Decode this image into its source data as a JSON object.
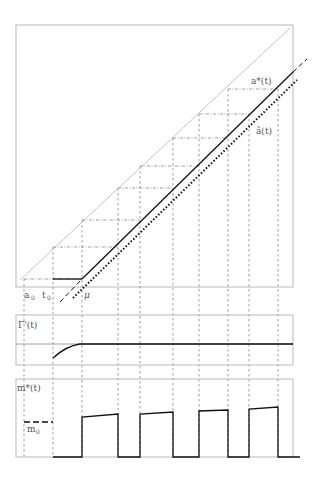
{
  "figure": {
    "panels": [
      {
        "id": "main",
        "description": "threshold diagram with diagonal and a*(t), ã(t) lines"
      },
      {
        "id": "gamma",
        "label": "Γ'(t)"
      },
      {
        "id": "mstar",
        "label": "m*(t)"
      }
    ],
    "labels": {
      "a_star": "a*(t)",
      "a_tilde": "ã(t)",
      "a0_base": "a",
      "a0_sub": "0",
      "t0_base": "t",
      "t0_sub": "0",
      "mu": "μ",
      "gamma_prime": "Γ'(t)",
      "m_star": "m*(t)",
      "m0_base": "m",
      "m0_sub": "0"
    },
    "vertical_grid_x": [
      24,
      53,
      82,
      118,
      140,
      173,
      199,
      228,
      249,
      278
    ],
    "horizontal_grid": [
      {
        "y": 279,
        "x1": 24,
        "x2": 82
      },
      {
        "y": 247,
        "x1": 53,
        "x2": 118
      },
      {
        "y": 220,
        "x1": 82,
        "x2": 140
      },
      {
        "y": 188,
        "x1": 118,
        "x2": 173
      },
      {
        "y": 166,
        "x1": 140,
        "x2": 199
      },
      {
        "y": 138,
        "x1": 173,
        "x2": 228
      },
      {
        "y": 114,
        "x1": 199,
        "x2": 249
      },
      {
        "y": 89,
        "x1": 228,
        "x2": 278
      }
    ],
    "pulses": [
      {
        "rise_x": 82,
        "fall_x": 118,
        "y_start": 417,
        "y_end": 414
      },
      {
        "rise_x": 140,
        "fall_x": 173,
        "y_start": 414,
        "y_end": 412
      },
      {
        "rise_x": 199,
        "fall_x": 228,
        "y_start": 411,
        "y_end": 410
      },
      {
        "rise_x": 249,
        "fall_x": 278,
        "y_start": 409,
        "y_end": 407
      }
    ],
    "colors": {
      "frame": "#b8b8b8",
      "diagonal": "#c4c4c4",
      "grid": "#777777",
      "curve": "#111111"
    }
  }
}
